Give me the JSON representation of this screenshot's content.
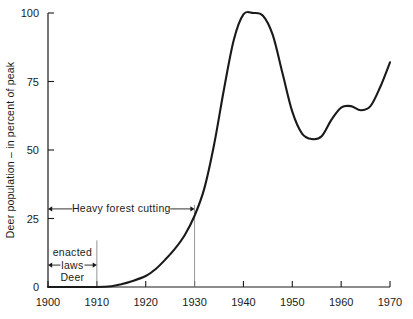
{
  "chart_data": {
    "type": "line",
    "title": "",
    "xlabel": "",
    "ylabel": "Deer population – in percent of peak",
    "xlim": [
      1900,
      1970
    ],
    "ylim": [
      0,
      100
    ],
    "grid": false,
    "legend": "none",
    "x_ticks": [
      "1900",
      "1910",
      "1920",
      "1930",
      "1940",
      "1950",
      "1960",
      "1970"
    ],
    "x_tick_values": [
      1900,
      1910,
      1920,
      1930,
      1940,
      1950,
      1960,
      1970
    ],
    "y_ticks": [
      "0",
      "25",
      "50",
      "75",
      "100"
    ],
    "y_tick_values": [
      0,
      25,
      50,
      75,
      100
    ],
    "series": [
      {
        "name": "Deer population",
        "x": [
          1900,
          1905,
          1910,
          1913,
          1915,
          1917,
          1920,
          1922,
          1924,
          1926,
          1928,
          1930,
          1932,
          1934,
          1936,
          1938,
          1940,
          1942,
          1944,
          1946,
          1948,
          1950,
          1952,
          1954,
          1956,
          1958,
          1960,
          1962,
          1964,
          1966,
          1968,
          1970
        ],
        "values": [
          0,
          0,
          0,
          0.3,
          1,
          2,
          4,
          6.5,
          10,
          14,
          19,
          26,
          36,
          52,
          72,
          90,
          99.5,
          100,
          99,
          92,
          78,
          64,
          56,
          54,
          55,
          61,
          65.5,
          66,
          64.5,
          66,
          73,
          82
        ]
      }
    ],
    "annotations": [
      {
        "id": "heavy-forest-cutting",
        "label": "Heavy forest cutting",
        "x_start": 1900,
        "x_end": 1930,
        "y": 28.5,
        "style": "double-arrow"
      },
      {
        "id": "deer-laws-enacted",
        "label_line1": "Deer",
        "label_line2": "laws",
        "label_line3": "enacted",
        "x_start": 1900,
        "x_end": 1910,
        "y": 8,
        "style": "double-arrow"
      }
    ],
    "guides": [
      {
        "id": "guide-1910",
        "x": 1910,
        "y_top": 17,
        "y_bottom": 0
      },
      {
        "id": "guide-1930",
        "x": 1930,
        "y_top": 30,
        "y_bottom": 0
      }
    ]
  }
}
